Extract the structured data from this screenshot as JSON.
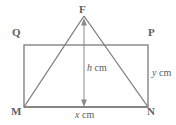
{
  "figure": {
    "background_color": "#ffffff",
    "stroke_color": "#7b7b7b",
    "label_color": "#5f5f5f",
    "vertices": {
      "F": {
        "label": "F",
        "x": 84,
        "y": 16
      },
      "Q": {
        "label": "Q",
        "x": 24,
        "y": 45
      },
      "P": {
        "label": "P",
        "x": 148,
        "y": 45
      },
      "M": {
        "label": "M",
        "x": 24,
        "y": 107
      },
      "N": {
        "label": "N",
        "x": 148,
        "y": 107
      }
    },
    "rectangle": {
      "name": "QPNM",
      "left": 24,
      "top": 45,
      "right": 148,
      "bottom": 107,
      "width": 124,
      "height": 62
    },
    "triangle": {
      "name": "FMN",
      "apex": {
        "x": 84,
        "y": 16
      },
      "base_left": {
        "x": 24,
        "y": 107
      },
      "base_right": {
        "x": 148,
        "y": 107
      }
    },
    "height_arrow": {
      "name": "h-dimension-arrow",
      "x": 84,
      "y_top": 18,
      "y_bottom": 107,
      "double_headed": true
    },
    "measures": {
      "height": {
        "variable": "h",
        "unit": "cm",
        "text": "h cm"
      },
      "side": {
        "variable": "y",
        "unit": "cm",
        "text": "y cm"
      },
      "base": {
        "variable": "x",
        "unit": "cm",
        "text": "x cm"
      }
    }
  }
}
